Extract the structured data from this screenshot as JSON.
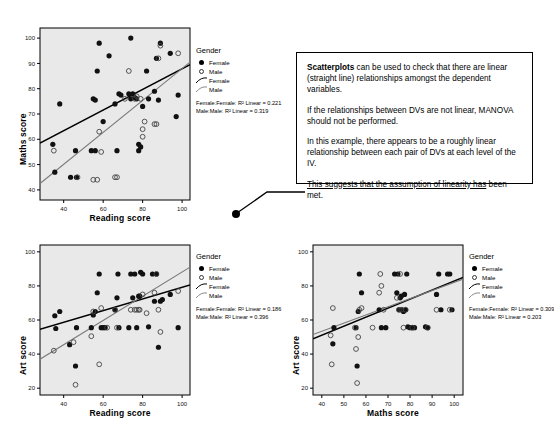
{
  "legend": {
    "title": "Gender",
    "entries": [
      {
        "key": "filled-circle",
        "label": "Female"
      },
      {
        "key": "open-circle",
        "label": "Male"
      },
      {
        "key": "line-dark",
        "label": "Female"
      },
      {
        "key": "line-grey",
        "label": "Male"
      }
    ]
  },
  "callout": {
    "para1_bold": "Scatterplots",
    "para1_rest": " can be used to check that there are linear (straight line) relationships amongst the dependent variables.",
    "para2": "If the relationships between DVs are not linear, MANOVA should not be performed.",
    "para3": "In this example, there appears to be a roughly linear relationship between each pair of DVs at each level of the IV.",
    "para4_underline": "This suggests that the assumption of linearity has",
    "para4_rest": " been met."
  },
  "chart_data": [
    {
      "id": "maths-vs-reading",
      "type": "scatter",
      "title": "",
      "xlabel": "Reading score",
      "ylabel": "Maths score",
      "xlim": [
        28,
        104
      ],
      "ylim": [
        36,
        104
      ],
      "xticks": [
        40,
        60,
        80,
        100
      ],
      "yticks": [
        40,
        50,
        60,
        70,
        80,
        90,
        100
      ],
      "grid": false,
      "legend_position": "right",
      "annotations": [
        "Female:Female: R² Linear = 0.221",
        "Male:Male: R² Linear = 0.319"
      ],
      "r2_female": 0.221,
      "r2_male": 0.319,
      "fits": [
        {
          "name": "Female",
          "color": "#000000",
          "x": [
            28,
            104
          ],
          "y": [
            58.5,
            89.5
          ]
        },
        {
          "name": "Male",
          "color": "#7a7a7a",
          "x": [
            28,
            104
          ],
          "y": [
            42.5,
            90.5
          ]
        }
      ],
      "series": [
        {
          "name": "Female",
          "marker": "filled-circle",
          "points": [
            [
              34.5,
              58
            ],
            [
              35.5,
              47
            ],
            [
              38,
              74
            ],
            [
              43.5,
              45
            ],
            [
              46,
              55.5
            ],
            [
              46.5,
              45
            ],
            [
              54,
              55.5
            ],
            [
              55,
              76
            ],
            [
              56,
              55.5
            ],
            [
              56,
              75.5
            ],
            [
              57,
              87
            ],
            [
              58,
              98
            ],
            [
              60,
              67
            ],
            [
              63,
              93
            ],
            [
              66,
              74
            ],
            [
              67,
              55.5
            ],
            [
              68,
              78
            ],
            [
              69,
              77.5
            ],
            [
              73,
              78
            ],
            [
              74,
              100
            ],
            [
              74,
              76
            ],
            [
              75,
              78
            ],
            [
              76,
              76.5
            ],
            [
              77,
              76
            ],
            [
              78,
              55.5
            ],
            [
              78,
              58
            ],
            [
              79,
              57
            ],
            [
              80,
              73
            ],
            [
              82,
              87
            ],
            [
              83,
              76
            ],
            [
              86,
              79
            ],
            [
              87,
              92
            ],
            [
              88,
              75.5
            ],
            [
              89,
              98
            ],
            [
              94,
              94
            ],
            [
              97,
              69
            ],
            [
              98,
              77.5
            ]
          ]
        },
        {
          "name": "Male",
          "marker": "open-circle",
          "points": [
            [
              35,
              55.5
            ],
            [
              47,
              45
            ],
            [
              55,
              44
            ],
            [
              57,
              44
            ],
            [
              58,
              63
            ],
            [
              59,
              55
            ],
            [
              66,
              45
            ],
            [
              67,
              45
            ],
            [
              71,
              76
            ],
            [
              73,
              87
            ],
            [
              76,
              76
            ],
            [
              77,
              77
            ],
            [
              79,
              76
            ],
            [
              80,
              61
            ],
            [
              80,
              64
            ],
            [
              81,
              67
            ],
            [
              86,
              66
            ],
            [
              87,
              66
            ],
            [
              88,
              92
            ],
            [
              89,
              97
            ],
            [
              98,
              94
            ]
          ]
        }
      ]
    },
    {
      "id": "art-vs-reading",
      "type": "scatter",
      "title": "",
      "xlabel": "Reading score",
      "ylabel": "Art score",
      "xlim": [
        28,
        104
      ],
      "ylim": [
        16,
        104
      ],
      "xticks": [
        40,
        60,
        80,
        100
      ],
      "yticks": [
        20,
        40,
        60,
        80,
        100
      ],
      "grid": false,
      "legend_position": "right",
      "annotations": [
        "Female:Female: R² Linear = 0.186",
        "Male:Male: R² Linear = 0.396"
      ],
      "r2_female": 0.186,
      "r2_male": 0.396,
      "fits": [
        {
          "name": "Female",
          "color": "#000000",
          "x": [
            28,
            104
          ],
          "y": [
            54.5,
            80.5
          ]
        },
        {
          "name": "Male",
          "color": "#7a7a7a",
          "x": [
            28,
            104
          ],
          "y": [
            37.0,
            91.0
          ]
        }
      ],
      "series": [
        {
          "name": "Female",
          "marker": "filled-circle",
          "points": [
            [
              35.5,
              62.5
            ],
            [
              36,
              55
            ],
            [
              38,
              65
            ],
            [
              43,
              45.5
            ],
            [
              46,
              33
            ],
            [
              46.5,
              55.5
            ],
            [
              54,
              55.5
            ],
            [
              55,
              63
            ],
            [
              56,
              65
            ],
            [
              57,
              76
            ],
            [
              58,
              87
            ],
            [
              59,
              55.5
            ],
            [
              60,
              55.5
            ],
            [
              61,
              55.5
            ],
            [
              66,
              66
            ],
            [
              67,
              73
            ],
            [
              67.5,
              87
            ],
            [
              68,
              55.5
            ],
            [
              73,
              55.5
            ],
            [
              74,
              87
            ],
            [
              75,
              73
            ],
            [
              76,
              87
            ],
            [
              77,
              55.5
            ],
            [
              78,
              74
            ],
            [
              78.5,
              74
            ],
            [
              79,
              88
            ],
            [
              80,
              87
            ],
            [
              83,
              56
            ],
            [
              85,
              87
            ],
            [
              86,
              71
            ],
            [
              87,
              87
            ],
            [
              88,
              44
            ],
            [
              89,
              71
            ],
            [
              90,
              72
            ],
            [
              94,
              75
            ],
            [
              98,
              55.5
            ]
          ]
        },
        {
          "name": "Male",
          "marker": "open-circle",
          "points": [
            [
              35,
              42
            ],
            [
              45,
              47
            ],
            [
              46,
              22
            ],
            [
              54,
              50.5
            ],
            [
              55,
              65
            ],
            [
              58,
              34
            ],
            [
              59,
              67
            ],
            [
              62,
              55.5
            ],
            [
              66,
              66
            ],
            [
              67,
              55.5
            ],
            [
              74,
              66
            ],
            [
              76,
              66
            ],
            [
              77,
              66
            ],
            [
              78,
              66
            ],
            [
              78.5,
              66
            ],
            [
              80,
              75
            ],
            [
              82,
              64
            ],
            [
              86,
              76
            ],
            [
              87,
              87
            ],
            [
              88,
              66
            ],
            [
              89,
              53
            ],
            [
              98,
              77
            ]
          ]
        }
      ]
    },
    {
      "id": "art-vs-maths",
      "type": "scatter",
      "title": "",
      "xlabel": "Maths score",
      "ylabel": "Art score",
      "xlim": [
        36,
        104
      ],
      "ylim": [
        16,
        104
      ],
      "xticks": [
        40,
        50,
        60,
        70,
        80,
        90,
        100
      ],
      "yticks": [
        20,
        40,
        60,
        80,
        100
      ],
      "grid": false,
      "legend_position": "right",
      "annotations": [
        "Female:Female: R² Linear = 0.309",
        "Male:Male: R² Linear = 0.203"
      ],
      "r2_female": 0.309,
      "r2_male": 0.203,
      "fits": [
        {
          "name": "Female",
          "color": "#000000",
          "x": [
            36,
            104
          ],
          "y": [
            49.0,
            85.0
          ]
        },
        {
          "name": "Male",
          "color": "#7a7a7a",
          "x": [
            36,
            104
          ],
          "y": [
            51.5,
            84.0
          ]
        }
      ],
      "series": [
        {
          "name": "Female",
          "marker": "filled-circle",
          "points": [
            [
              45,
              46
            ],
            [
              45.5,
              55.5
            ],
            [
              55.5,
              55.5
            ],
            [
              56,
              33
            ],
            [
              56.5,
              65
            ],
            [
              57,
              87
            ],
            [
              58,
              76
            ],
            [
              66,
              66
            ],
            [
              67,
              55.5
            ],
            [
              69,
              55.5
            ],
            [
              73,
              87
            ],
            [
              74,
              76
            ],
            [
              74.5,
              87
            ],
            [
              75,
              66
            ],
            [
              75.5,
              73
            ],
            [
              76,
              74
            ],
            [
              76.5,
              66
            ],
            [
              77,
              65
            ],
            [
              77.5,
              75
            ],
            [
              78,
              66
            ],
            [
              78.5,
              87
            ],
            [
              79,
              56
            ],
            [
              80,
              55.5
            ],
            [
              81,
              55.5
            ],
            [
              82,
              55.5
            ],
            [
              87,
              56
            ],
            [
              88,
              55.5
            ],
            [
              92,
              75
            ],
            [
              93,
              87
            ],
            [
              94,
              66
            ],
            [
              97,
              87
            ],
            [
              98,
              87
            ],
            [
              99,
              66
            ]
          ]
        },
        {
          "name": "Male",
          "marker": "open-circle",
          "points": [
            [
              44,
              51
            ],
            [
              44.5,
              34
            ],
            [
              45,
              67
            ],
            [
              55,
              55.5
            ],
            [
              55.5,
              43
            ],
            [
              56,
              23
            ],
            [
              56.5,
              50
            ],
            [
              57,
              66
            ],
            [
              58,
              67
            ],
            [
              63,
              55.5
            ],
            [
              66,
              76
            ],
            [
              66.5,
              87
            ],
            [
              67,
              80
            ],
            [
              68,
              66
            ],
            [
              74,
              73
            ],
            [
              75,
              66
            ],
            [
              75.5,
              87
            ],
            [
              76,
              66
            ],
            [
              77,
              55.5
            ],
            [
              78,
              66
            ],
            [
              81,
              55.5
            ],
            [
              88,
              55.5
            ],
            [
              92,
              66
            ],
            [
              98,
              66
            ]
          ]
        }
      ]
    }
  ]
}
